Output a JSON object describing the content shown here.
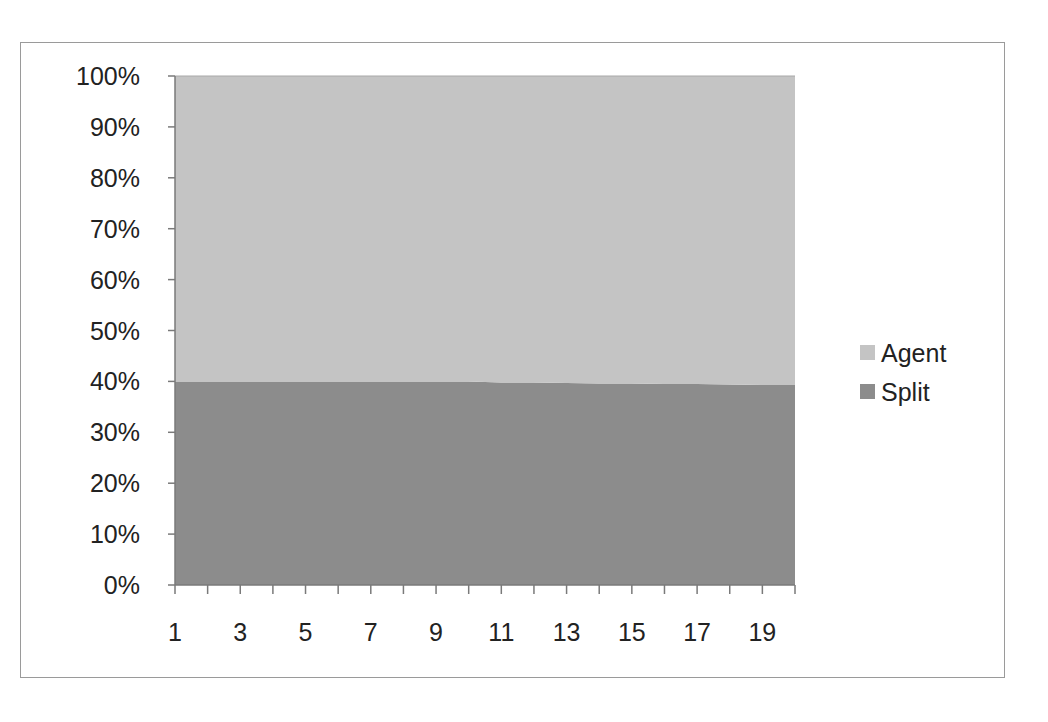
{
  "chart_data": {
    "type": "area",
    "stacking": "percent",
    "title": "",
    "xlabel": "",
    "ylabel": "",
    "x": [
      1,
      2,
      3,
      4,
      5,
      6,
      7,
      8,
      9,
      10,
      11,
      12,
      13,
      14,
      15,
      16,
      17,
      18,
      19,
      20
    ],
    "x_tick_labels": [
      "1",
      "3",
      "5",
      "7",
      "9",
      "11",
      "13",
      "15",
      "17",
      "19"
    ],
    "y_tick_labels": [
      "0%",
      "10%",
      "20%",
      "30%",
      "40%",
      "50%",
      "60%",
      "70%",
      "80%",
      "90%",
      "100%"
    ],
    "ylim": [
      0,
      100
    ],
    "grid": false,
    "legend_position": "right",
    "series": [
      {
        "name": "Split",
        "color": "#8c8c8c",
        "values": [
          40,
          40,
          40,
          40,
          40,
          40,
          40,
          40,
          40,
          40,
          39.8,
          39.8,
          39.7,
          39.6,
          39.6,
          39.5,
          39.5,
          39.4,
          39.3,
          39.3
        ]
      },
      {
        "name": "Agent",
        "color": "#c4c4c4",
        "values": [
          60,
          60,
          60,
          60,
          60,
          60,
          60,
          60,
          60,
          60,
          60.2,
          60.2,
          60.3,
          60.4,
          60.4,
          60.5,
          60.5,
          60.6,
          60.7,
          60.7
        ]
      }
    ]
  },
  "legend": {
    "items": [
      {
        "label": "Agent",
        "color": "#c4c4c4"
      },
      {
        "label": "Split",
        "color": "#8c8c8c"
      }
    ]
  }
}
